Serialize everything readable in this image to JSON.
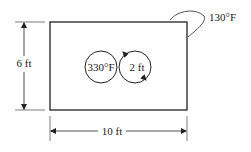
{
  "diagram": {
    "room": {
      "width_label": "10 ft",
      "height_label": "6 ft",
      "wall_temperature": "130°F"
    },
    "pipes": {
      "temperature": "330°F",
      "diameter_label": "2 ft",
      "count": 2
    },
    "colors": {
      "line": "#222222",
      "background": "#ffffff"
    }
  }
}
